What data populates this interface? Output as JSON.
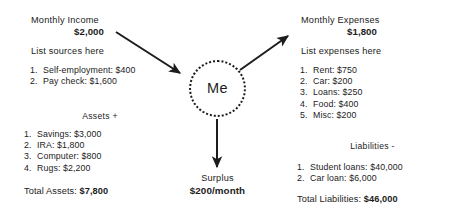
{
  "diagram": {
    "type": "personal-finance-flow",
    "background_color": "#ffffff",
    "text_color": "#1c1c1c",
    "center": {
      "label": "Me",
      "shape": "dotted-circle"
    },
    "income": {
      "title": "Monthly Income",
      "amount": "$2,000",
      "prompt": "List sources here",
      "items": [
        {
          "num": "1.",
          "text": "Self-employment: $400"
        },
        {
          "num": "2.",
          "text": "Pay check: $1,600"
        }
      ]
    },
    "assets": {
      "title": "Assets +",
      "items": [
        {
          "num": "1.",
          "text": "Savings: $3,000"
        },
        {
          "num": "2.",
          "text": "IRA: $1,800"
        },
        {
          "num": "3.",
          "text": "Computer: $800"
        },
        {
          "num": "4.",
          "text": "Rugs: $2,200"
        }
      ],
      "total_label": "Total Assets:",
      "total_value": "$7,800"
    },
    "expenses": {
      "title": "Monthly Expenses",
      "amount": "$1,800",
      "prompt": "List expenses here",
      "items": [
        {
          "num": "1.",
          "text": "Rent: $750"
        },
        {
          "num": "2.",
          "text": "Car: $200"
        },
        {
          "num": "3.",
          "text": "Loans: $250"
        },
        {
          "num": "4.",
          "text": "Food: $400"
        },
        {
          "num": "5.",
          "text": "Misc: $200"
        }
      ]
    },
    "liabilities": {
      "title": "Liabilities -",
      "items": [
        {
          "num": "1.",
          "text": "Student loans: $40,000"
        },
        {
          "num": "2.",
          "text": "Car loan: $6,000"
        }
      ],
      "total_label": "Total Liabilities:",
      "total_value": "$46,000"
    },
    "surplus": {
      "label": "Surplus",
      "amount": "$200/month"
    },
    "arrows": [
      {
        "name": "income-to-me",
        "direction": "down-right"
      },
      {
        "name": "me-to-expenses",
        "direction": "up-right"
      },
      {
        "name": "me-to-surplus",
        "direction": "down"
      }
    ]
  }
}
